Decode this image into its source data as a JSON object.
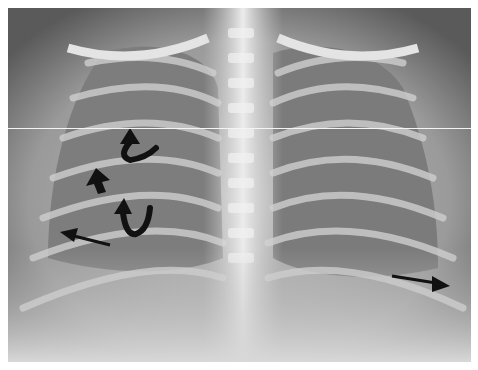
{
  "image": {
    "type": "chest-radiograph",
    "view": "frontal",
    "grayscale": true,
    "background": "#ffffff"
  },
  "annotations": [
    {
      "name": "curved-arrow-upper",
      "kind": "curved-arrow",
      "x": 130,
      "y": 145,
      "direction": "up"
    },
    {
      "name": "arrowhead-left",
      "kind": "arrowhead",
      "x": 95,
      "y": 175,
      "direction": "up-left"
    },
    {
      "name": "curved-arrow-lower",
      "kind": "curved-arrow",
      "x": 125,
      "y": 215,
      "direction": "up"
    },
    {
      "name": "straight-arrow-left",
      "kind": "arrow",
      "x": 80,
      "y": 240,
      "direction": "left"
    },
    {
      "name": "straight-arrow-right",
      "kind": "arrow",
      "x": 415,
      "y": 280,
      "direction": "right"
    }
  ],
  "colors": {
    "arrow": "#111111",
    "bone": "#e6e6e6",
    "lung": "#6e6e6e"
  }
}
